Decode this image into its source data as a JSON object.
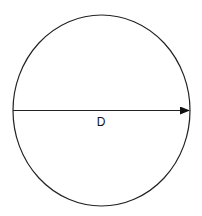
{
  "diagram": {
    "shape": "circle",
    "label": "D",
    "meaning": "diameter",
    "stroke_color": "#222222",
    "background": "#ffffff"
  }
}
